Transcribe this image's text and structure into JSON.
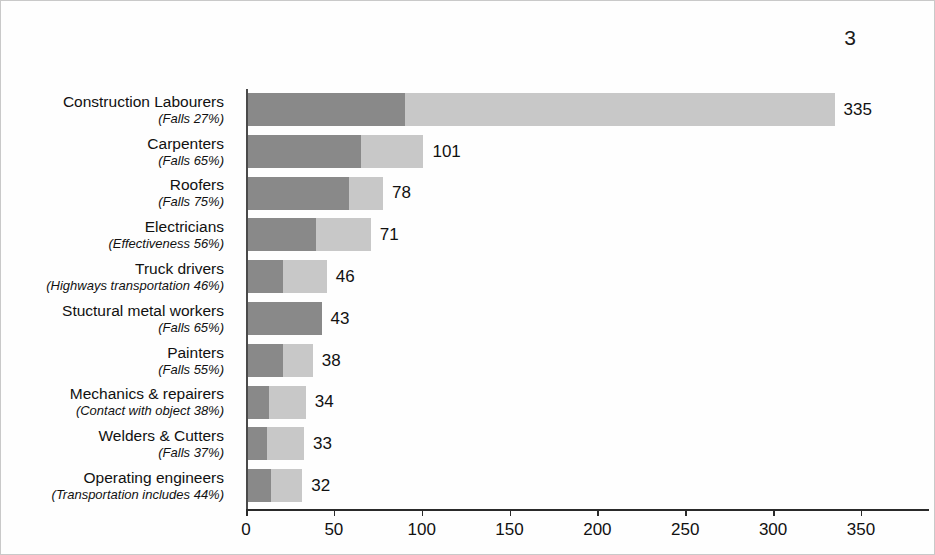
{
  "page": {
    "number": "3"
  },
  "chart_data": {
    "type": "bar",
    "orientation": "horizontal",
    "stacked": true,
    "title": "",
    "xlabel": "",
    "ylabel": "",
    "xlim": [
      0,
      388
    ],
    "grid": false,
    "legend": "none",
    "axis_ticks": [
      0,
      50,
      100,
      150,
      200,
      250,
      300,
      350
    ],
    "axis_tick_labels": [
      "0",
      "50",
      "100",
      "150",
      "200",
      "250",
      "300",
      "350"
    ],
    "colors": {
      "primary_segment": "#898989",
      "secondary_segment": "#c8c8c8",
      "axis": "#2a2a2a",
      "text": "#111111"
    },
    "categories": [
      "Construction Labourers",
      "Carpenters",
      "Roofers",
      "Electricians",
      "Truck drivers",
      "Stuctural metal workers",
      "Painters",
      "Mechanics & repairers",
      "Welders & Cutters",
      "Operating engineers"
    ],
    "values": [
      335,
      101,
      78,
      71,
      46,
      43,
      38,
      34,
      33,
      32
    ],
    "subcategory_notes": [
      "(Falls 27%)",
      "(Falls 65%)",
      "(Falls 75%)",
      "(Effectiveness 56%)",
      "(Highways transportation 46%)",
      "(Falls 65%)",
      "(Falls 55%)",
      "(Contact with object 38%)",
      "(Falls 37%)",
      "(Transportation includes 44%)"
    ],
    "leading_cause_percent": [
      27,
      65,
      75,
      56,
      46,
      65,
      55,
      38,
      37,
      44
    ],
    "series": [
      {
        "name": "leading cause share",
        "values": [
          90.5,
          65.7,
          58.5,
          39.8,
          21.2,
          43,
          20.9,
          12.9,
          12.2,
          14.1
        ]
      },
      {
        "name": "remainder",
        "values": [
          244.5,
          35.3,
          19.5,
          31.2,
          24.8,
          0,
          17.1,
          21.1,
          20.8,
          17.9
        ]
      }
    ],
    "rows": [
      {
        "name": "Construction Labourers",
        "note": "(Falls 27%)",
        "total": "335",
        "dark": 90.5,
        "light": 244.5
      },
      {
        "name": "Carpenters",
        "note": "(Falls 65%)",
        "total": "101",
        "dark": 65.7,
        "light": 35.3
      },
      {
        "name": "Roofers",
        "note": "(Falls 75%)",
        "total": "78",
        "dark": 58.5,
        "light": 19.5
      },
      {
        "name": "Electricians",
        "note": "(Effectiveness 56%)",
        "total": "71",
        "dark": 39.8,
        "light": 31.2
      },
      {
        "name": "Truck drivers",
        "note": "(Highways transportation 46%)",
        "total": "46",
        "dark": 21.2,
        "light": 24.8
      },
      {
        "name": "Stuctural metal workers",
        "note": "(Falls 65%)",
        "total": "43",
        "dark": 43,
        "light": 0
      },
      {
        "name": "Painters",
        "note": "(Falls 55%)",
        "total": "38",
        "dark": 20.9,
        "light": 17.1
      },
      {
        "name": "Mechanics & repairers",
        "note": "(Contact with object 38%)",
        "total": "34",
        "dark": 12.9,
        "light": 21.1
      },
      {
        "name": "Welders & Cutters",
        "note": "(Falls 37%)",
        "total": "33",
        "dark": 12.2,
        "light": 20.8
      },
      {
        "name": "Operating engineers",
        "note": "(Transportation includes 44%)",
        "total": "32",
        "dark": 14.1,
        "light": 17.9
      }
    ]
  }
}
